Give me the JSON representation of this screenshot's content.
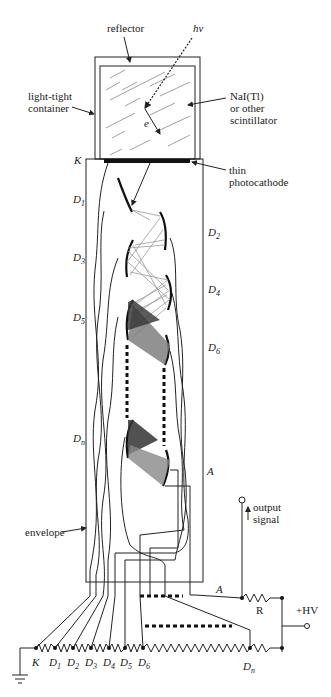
{
  "labels": {
    "reflector": "reflector",
    "photon": "hν",
    "container_line1": "light-tight",
    "container_line2": "container",
    "scint_line1": "NaI(Tl)",
    "scint_line2": "or other",
    "scint_line3": "scintillator",
    "electron": "e",
    "cathode": "K",
    "photocathode_line1": "thin",
    "photocathode_line2": "photocathode",
    "envelope": "envelope",
    "output_line1": "output",
    "output_line2": "signal",
    "anode": "A",
    "resistor": "R",
    "hv": "+HV"
  },
  "dynode_labels": {
    "left": [
      {
        "base": "D",
        "sub": "1"
      },
      {
        "base": "D",
        "sub": "3"
      },
      {
        "base": "D",
        "sub": "5"
      },
      {
        "base": "D",
        "sub": "n"
      }
    ],
    "right": [
      {
        "base": "D",
        "sub": "2"
      },
      {
        "base": "D",
        "sub": "4"
      },
      {
        "base": "D",
        "sub": "6"
      }
    ],
    "anode_right": "A"
  },
  "divider_labels": [
    {
      "base": "K",
      "sub": ""
    },
    {
      "base": "D",
      "sub": "1"
    },
    {
      "base": "D",
      "sub": "2"
    },
    {
      "base": "D",
      "sub": "3"
    },
    {
      "base": "D",
      "sub": "4"
    },
    {
      "base": "D",
      "sub": "5"
    },
    {
      "base": "D",
      "sub": "6"
    },
    {
      "base": "D",
      "sub": "n"
    }
  ]
}
